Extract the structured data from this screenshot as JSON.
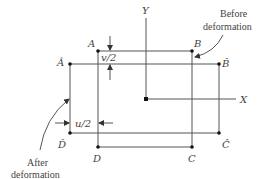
{
  "diagram": {
    "type": "deformation-of-rectangular-element",
    "axes": {
      "x_label": "X",
      "y_label": "Y"
    },
    "before_deformation": {
      "caption": [
        "Before",
        "deformation"
      ],
      "vertices": {
        "A": "A",
        "B": "B",
        "C": "C",
        "D": "D"
      }
    },
    "after_deformation": {
      "caption": [
        "After",
        "deformation"
      ],
      "vertices": {
        "A": "Â",
        "B": "B̂",
        "C": "Ĉ",
        "D": "D̂"
      }
    },
    "dimensions": {
      "vertical": "v/2",
      "horizontal": "u/2"
    }
  }
}
